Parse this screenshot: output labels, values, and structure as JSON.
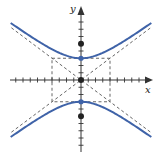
{
  "diagram": {
    "type": "hyperbola",
    "equation_form": "y^2/a^2 - x^2/b^2 = 1",
    "params": {
      "a": 3,
      "b": 4,
      "c": 5
    },
    "axes": {
      "x_label": "x",
      "y_label": "y",
      "x_range": [
        -10,
        10
      ],
      "y_range": [
        -10,
        10
      ],
      "tick_step": 1
    },
    "center": {
      "x": 0,
      "y": 0
    },
    "vertices": [
      {
        "x": 0,
        "y": 3
      },
      {
        "x": 0,
        "y": -3
      }
    ],
    "foci": [
      {
        "x": 0,
        "y": 5
      },
      {
        "x": 0,
        "y": -5
      }
    ],
    "fundamental_rectangle": {
      "x_min": -4,
      "x_max": 4,
      "y_min": -3,
      "y_max": 3
    },
    "asymptotes": [
      "y = 3x/4",
      "y = -3x/4"
    ],
    "colors": {
      "curve": "#3f63a8",
      "axes": "#333333",
      "dashed": "#555555",
      "points": "#222222",
      "vertex_points": "#3f63a8"
    }
  }
}
